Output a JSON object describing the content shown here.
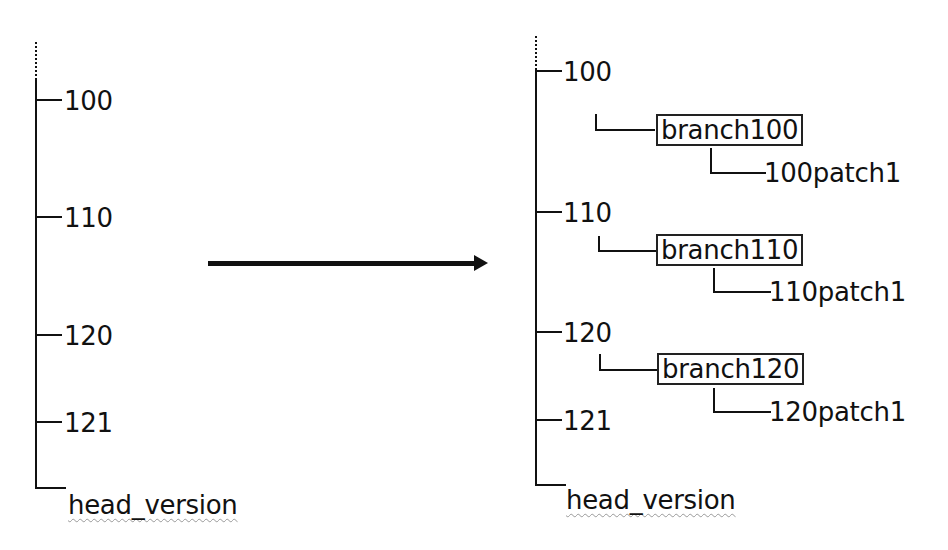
{
  "left_tree": {
    "versions": [
      "100",
      "110",
      "120",
      "121"
    ],
    "head_label": "head_version"
  },
  "arrow": {
    "direction": "right"
  },
  "right_tree": {
    "versions": [
      {
        "label": "100",
        "branch": "branch100",
        "patch": "100patch1"
      },
      {
        "label": "110",
        "branch": "branch110",
        "patch": "110patch1"
      },
      {
        "label": "120",
        "branch": "branch120",
        "patch": "120patch1"
      },
      {
        "label": "121"
      }
    ],
    "head_label": "head_version"
  },
  "colors": {
    "line": "#111111",
    "background": "#ffffff",
    "spellcheck_underline": "#999999"
  }
}
